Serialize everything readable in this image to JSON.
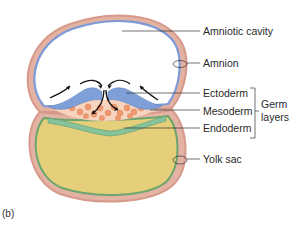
{
  "figure": {
    "panel_label": "(b)",
    "labels": {
      "amniotic_cavity": "Amniotic cavity",
      "amnion": "Amnion",
      "ectoderm": "Ectoderm",
      "mesoderm": "Mesoderm",
      "endoderm": "Endoderm",
      "germ_layers_line1": "Germ",
      "germ_layers_line2": "layers",
      "yolk_sac": "Yolk sac"
    },
    "colors": {
      "outer_membrane": "#d99a8a",
      "amnion_blue": "#7b9ad6",
      "ectoderm_blue": "#7f9fd8",
      "mesoderm_orange": "#ef9a6e",
      "endoderm_green": "#86c29a",
      "yolk": "#e6cf7a",
      "yolk_inner_green": "#6aa66e",
      "leader_line": "#333333"
    }
  }
}
